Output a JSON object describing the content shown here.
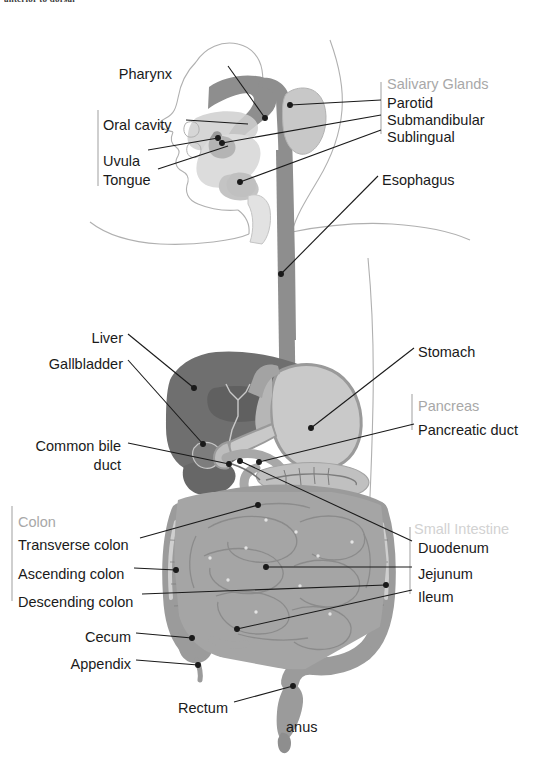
{
  "figure": {
    "cropped_header_text": "anterior to dorsal",
    "palette": {
      "background": "#ffffff",
      "body_outline": "#a9a9a9",
      "tract_dark": "#8c8c8c",
      "liver_dark": "#6f6f6f",
      "liver_shadow": "#5d5d5d",
      "stomach_light": "#c9c9c9",
      "stomach_rim": "#9a9a9a",
      "intestine_gray": "#a5a5a5",
      "colon_gray": "#9b9b9b",
      "gland_light": "#c2c2c2",
      "leader_line": "#1a1a1a",
      "label_text": "#1a1a1a",
      "group_label_text": "#a8a8a8",
      "bracket_line": "#b5b5b5"
    },
    "labels": [
      {
        "id": "pharynx",
        "text": "Pharynx",
        "kind": "part",
        "align": "right",
        "x": 172,
        "y": 66,
        "tip_x": 265,
        "tip_y": 118
      },
      {
        "id": "oral-cavity",
        "text": "Oral cavity",
        "kind": "part",
        "align": "left",
        "x": 103,
        "y": 117,
        "tip_x": 248,
        "tip_y": 124
      },
      {
        "id": "uvula",
        "text": "Uvula",
        "kind": "part",
        "align": "left",
        "x": 103,
        "y": 153,
        "tip_x": 218,
        "tip_y": 138
      },
      {
        "id": "tongue",
        "text": "Tongue",
        "kind": "part",
        "align": "left",
        "x": 103,
        "y": 172,
        "tip_x": 228,
        "tip_y": 146
      },
      {
        "id": "salivary-glands",
        "text": "Salivary Glands",
        "kind": "group",
        "align": "left",
        "x": 387,
        "y": 76
      },
      {
        "id": "parotid",
        "text": "Parotid",
        "kind": "part",
        "align": "left",
        "x": 387,
        "y": 95,
        "tip_x": 290,
        "tip_y": 105
      },
      {
        "id": "submandibular",
        "text": "Submandibular",
        "kind": "part",
        "align": "left",
        "x": 387,
        "y": 112,
        "tip_x": 222,
        "tip_y": 143
      },
      {
        "id": "sublingual",
        "text": "Sublingual",
        "kind": "part",
        "align": "left",
        "x": 387,
        "y": 129,
        "tip_x": 240,
        "tip_y": 182
      },
      {
        "id": "esophagus",
        "text": "Esophagus",
        "kind": "part",
        "align": "left",
        "x": 382,
        "y": 172,
        "tip_x": 281,
        "tip_y": 274
      },
      {
        "id": "liver",
        "text": "Liver",
        "kind": "part",
        "align": "right",
        "x": 123,
        "y": 330,
        "tip_x": 194,
        "tip_y": 388
      },
      {
        "id": "gallbladder",
        "text": "Gallbladder",
        "kind": "part",
        "align": "right",
        "x": 123,
        "y": 356,
        "tip_x": 203,
        "tip_y": 444
      },
      {
        "id": "common-bile-duct",
        "text": "Common bile duct",
        "kind": "part",
        "align": "right",
        "x": 121,
        "y": 437,
        "tip_x": 229,
        "tip_y": 464
      },
      {
        "id": "stomach",
        "text": "Stomach",
        "kind": "part",
        "align": "left",
        "x": 418,
        "y": 344,
        "tip_x": 311,
        "tip_y": 428
      },
      {
        "id": "pancreas",
        "text": "Pancreas",
        "kind": "group",
        "align": "left",
        "x": 418,
        "y": 398
      },
      {
        "id": "pancreatic-duct",
        "text": "Pancreatic duct",
        "kind": "part",
        "align": "left",
        "x": 418,
        "y": 422,
        "tip_x": 259,
        "tip_y": 462
      },
      {
        "id": "colon",
        "text": "Colon",
        "kind": "group",
        "align": "left",
        "x": 18,
        "y": 514
      },
      {
        "id": "transverse-colon",
        "text": "Transverse colon",
        "kind": "part",
        "align": "left",
        "x": 18,
        "y": 537,
        "tip_x": 258,
        "tip_y": 505
      },
      {
        "id": "ascending-colon",
        "text": "Ascending colon",
        "kind": "part",
        "align": "left",
        "x": 18,
        "y": 566,
        "tip_x": 176,
        "tip_y": 570
      },
      {
        "id": "descending-colon",
        "text": "Descending colon",
        "kind": "part",
        "align": "left",
        "x": 18,
        "y": 594,
        "tip_x": 175,
        "tip_y": 591
      },
      {
        "id": "cecum",
        "text": "Cecum",
        "kind": "part",
        "align": "right",
        "x": 131,
        "y": 629,
        "tip_x": 192,
        "tip_y": 638
      },
      {
        "id": "appendix",
        "text": "Appendix",
        "kind": "part",
        "align": "right",
        "x": 131,
        "y": 656,
        "tip_x": 198,
        "tip_y": 665
      },
      {
        "id": "rectum",
        "text": "Rectum",
        "kind": "part",
        "align": "right",
        "x": 228,
        "y": 700,
        "tip_x": 293,
        "tip_y": 686
      },
      {
        "id": "anus",
        "text": "anus",
        "kind": "part",
        "align": "left",
        "x": 286,
        "y": 719
      },
      {
        "id": "small-intestine",
        "text": "Small Intestine",
        "kind": "group",
        "align": "left",
        "x": 414,
        "y": 521
      },
      {
        "id": "duodenum",
        "text": "Duodenum",
        "kind": "part",
        "align": "left",
        "x": 418,
        "y": 540,
        "tip_x": 240,
        "tip_y": 461
      },
      {
        "id": "jejunum",
        "text": "Jejunum",
        "kind": "part",
        "align": "left",
        "x": 418,
        "y": 566,
        "tip_x": 266,
        "tip_y": 567
      },
      {
        "id": "ileum",
        "text": "Ileum",
        "kind": "part",
        "align": "left",
        "x": 418,
        "y": 589,
        "tip_x": 237,
        "tip_y": 629
      }
    ],
    "brackets": [
      {
        "id": "oral-cavity-bracket",
        "x": 98,
        "y1": 110,
        "y2": 186
      },
      {
        "id": "salivary-glands-bracket",
        "x": 381,
        "y1": 82,
        "y2": 134
      },
      {
        "id": "colon-bracket",
        "x": 12,
        "y1": 506,
        "y2": 601
      },
      {
        "id": "small-intestine-bracket",
        "x": 410,
        "y1": 527,
        "y2": 594
      },
      {
        "id": "pancreas-bracket",
        "x": 412,
        "y1": 394,
        "y2": 430
      }
    ]
  }
}
